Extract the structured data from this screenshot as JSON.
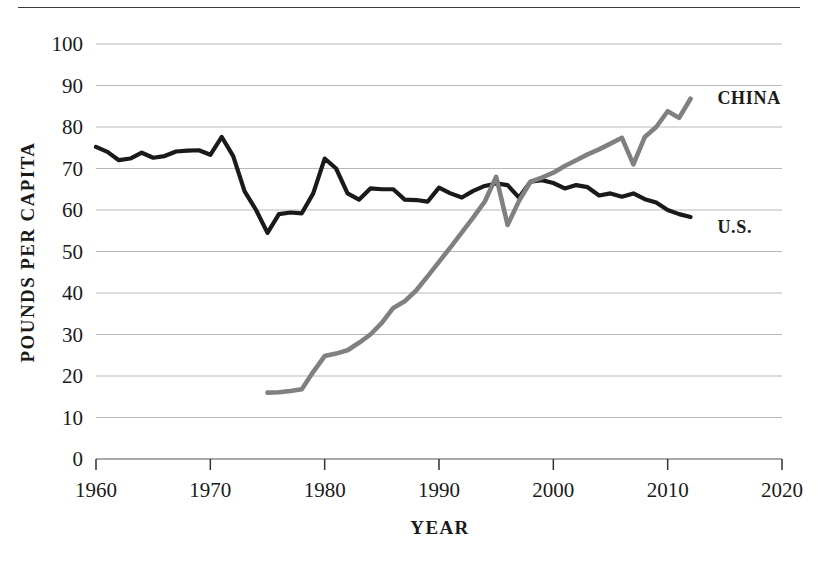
{
  "chart_data": {
    "type": "line",
    "title": "",
    "subtitle": "",
    "xlabel": "YEAR",
    "ylabel": "POUNDS PER CAPITA",
    "xlim": [
      1960,
      2020
    ],
    "ylim": [
      0,
      100
    ],
    "xticks": [
      1960,
      1970,
      1980,
      1990,
      2000,
      2010,
      2020
    ],
    "yticks": [
      0,
      10,
      20,
      30,
      40,
      50,
      60,
      70,
      80,
      90,
      100
    ],
    "grid": "horizontal",
    "legend_position": "inline-right-of-series",
    "series": [
      {
        "name": "U.S.",
        "color": "#1a1a1a",
        "label_x": 2014,
        "label_y": 56,
        "x": [
          1960,
          1961,
          1962,
          1963,
          1964,
          1965,
          1966,
          1967,
          1968,
          1969,
          1970,
          1971,
          1972,
          1973,
          1974,
          1975,
          1976,
          1977,
          1978,
          1979,
          1980,
          1981,
          1982,
          1983,
          1984,
          1985,
          1986,
          1987,
          1988,
          1989,
          1990,
          1991,
          1992,
          1993,
          1994,
          1995,
          1996,
          1997,
          1998,
          1999,
          2000,
          2001,
          2002,
          2003,
          2004,
          2005,
          2006,
          2007,
          2008,
          2009,
          2010,
          2011,
          2012
        ],
        "values": [
          75.2,
          74.0,
          72.0,
          72.4,
          73.8,
          72.6,
          73.0,
          74.1,
          74.3,
          74.4,
          73.3,
          77.6,
          73.0,
          64.5,
          60.0,
          54.5,
          59.0,
          59.4,
          59.2,
          64.0,
          72.4,
          70.0,
          64.0,
          62.5,
          65.2,
          65.0,
          65.0,
          62.5,
          62.4,
          62.0,
          65.4,
          64.0,
          63.0,
          64.6,
          65.8,
          66.4,
          66.0,
          63.0,
          66.8,
          67.2,
          66.5,
          65.2,
          66.0,
          65.5,
          63.5,
          64.0,
          63.2,
          64.0,
          62.6,
          61.8,
          60.0,
          59.0,
          58.3
        ]
      },
      {
        "name": "CHINA",
        "color": "#808080",
        "label_x": 2014,
        "label_y": 87,
        "x": [
          1975,
          1976,
          1977,
          1978,
          1979,
          1980,
          1981,
          1982,
          1983,
          1984,
          1985,
          1986,
          1987,
          1988,
          1989,
          1990,
          1991,
          1992,
          1993,
          1994,
          1995,
          1996,
          1997,
          1998,
          1999,
          2000,
          2001,
          2002,
          2003,
          2004,
          2005,
          2006,
          2007,
          2008,
          2009,
          2010,
          2011,
          2012
        ],
        "values": [
          16.0,
          16.1,
          16.4,
          16.8,
          21.0,
          24.8,
          25.4,
          26.2,
          28.0,
          30.0,
          32.8,
          36.4,
          38.0,
          40.6,
          44.0,
          47.5,
          51.0,
          54.6,
          58.2,
          62.0,
          68.0,
          56.4,
          62.2,
          66.8,
          67.8,
          69.0,
          70.6,
          72.0,
          73.4,
          74.6,
          76.0,
          77.4,
          71.0,
          77.6,
          80.0,
          83.8,
          82.2,
          86.8
        ]
      }
    ]
  },
  "axis": {
    "ylabel": "POUNDS PER CAPITA",
    "xlabel": "YEAR",
    "ytick_labels": [
      "100",
      "90",
      "80",
      "70",
      "60",
      "50",
      "40",
      "30",
      "20",
      "10",
      "0"
    ],
    "xtick_labels": [
      "1960",
      "1970",
      "1980",
      "1990",
      "2000",
      "2010",
      "2020"
    ]
  },
  "labels": {
    "china": "CHINA",
    "us": "U.S."
  },
  "colors": {
    "china_line": "#808080",
    "us_line": "#1a1a1a",
    "gridline": "#b9b9b9",
    "axis": "#555555",
    "text": "#1a1a1a",
    "background": "#ffffff"
  }
}
